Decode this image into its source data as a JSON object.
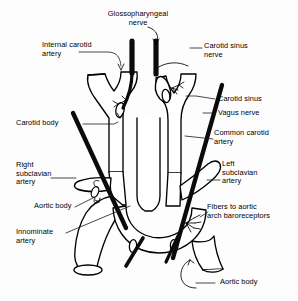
{
  "figure": {
    "background_color": "#fdfdfd",
    "ink_color": "#000000",
    "nerve_color": "#111111",
    "width": 298,
    "height": 301
  },
  "labels": {
    "internal_carotid_artery": "Internal carotid\nartery",
    "glossopharyngeal_nerve": "Glossopharyngeal\nnerve",
    "carotid_sinus_nerve": "Carotid sinus\nnerve",
    "carotid_sinus": "Carotid sinus",
    "vagus_nerve": "Vagus nerve",
    "common_carotid_artery": "Common carotid\nartery",
    "carotid_body": "Carotid body",
    "right_subclavian_artery": "Right\nsubclavian\nartery",
    "left_subclavian_artery": "Left\nsubclavian\nartery",
    "aortic_body_left": "Aortic body",
    "fibers_to_aortic_arch_baroreceptors": "Fibers to aortic\narch baroreceptors",
    "innominate_artery": "Innominate\nartery",
    "aortic_body_bottom": "Aortic body"
  },
  "structures": [
    {
      "name": "internal-carotid-artery",
      "kind": "vessel"
    },
    {
      "name": "external-carotid-artery",
      "kind": "vessel"
    },
    {
      "name": "common-carotid-artery",
      "kind": "vessel"
    },
    {
      "name": "carotid-sinus",
      "kind": "vessel-dilation"
    },
    {
      "name": "carotid-body",
      "kind": "chemoreceptor-body"
    },
    {
      "name": "aortic-body",
      "kind": "chemoreceptor-body"
    },
    {
      "name": "aortic-arch",
      "kind": "vessel"
    },
    {
      "name": "innominate-artery",
      "kind": "vessel"
    },
    {
      "name": "right-subclavian-artery",
      "kind": "vessel"
    },
    {
      "name": "left-subclavian-artery",
      "kind": "vessel"
    },
    {
      "name": "glossopharyngeal-nerve",
      "kind": "nerve-trunk"
    },
    {
      "name": "vagus-nerve",
      "kind": "nerve-trunk"
    },
    {
      "name": "carotid-sinus-nerve",
      "kind": "nerve-branch"
    },
    {
      "name": "aortic-baroreceptor-fibers",
      "kind": "nerve-branch"
    }
  ]
}
